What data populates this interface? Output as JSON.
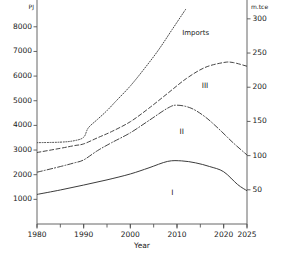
{
  "chart_data": {
    "type": "line",
    "title": "",
    "xlabel": "Year",
    "ylabel": "PJ",
    "ylabel_right": "m.tce",
    "xlim": [
      1980,
      2025
    ],
    "ylim": [
      0,
      8600
    ],
    "ylim_right": [
      0,
      310
    ],
    "grid": false,
    "legend": "none",
    "xticks": [
      1980,
      1990,
      2000,
      2010,
      2020,
      2025
    ],
    "xticklabels": [
      "1980",
      "1990",
      "2000",
      "2010",
      "2020",
      "2025"
    ],
    "yticks": [
      1000,
      2000,
      3000,
      4000,
      5000,
      6000,
      7000,
      8000
    ],
    "yticklabels": [
      "1000",
      "2000",
      "3000",
      "4000",
      "5000",
      "6000",
      "7000",
      "8000"
    ],
    "yticks_right": [
      50,
      100,
      150,
      200,
      250,
      300
    ],
    "yticklabels_right": [
      "50",
      "100",
      "150",
      "200",
      "250",
      "300"
    ],
    "annotations": [
      {
        "text": "Imports",
        "x": 2014,
        "y": 7750
      },
      {
        "text": "III",
        "x": 2016,
        "y": 5600
      },
      {
        "text": "II",
        "x": 2011,
        "y": 3750
      },
      {
        "text": "I",
        "x": 2009,
        "y": 1250
      }
    ],
    "series": [
      {
        "name": "Total demand",
        "style": "dotted",
        "x": [
          1980,
          1985,
          1988,
          1990,
          1991,
          1993,
          1995,
          1997,
          2000,
          2003,
          2006,
          2009,
          2012
        ],
        "values": [
          3300,
          3320,
          3380,
          3520,
          3900,
          4250,
          4600,
          5000,
          5600,
          6300,
          7050,
          7900,
          8750
        ]
      },
      {
        "name": "Cumulative III",
        "style": "dashed",
        "x": [
          1980,
          1985,
          1988,
          1990,
          1993,
          1996,
          2000,
          2004,
          2008,
          2012,
          2016,
          2020,
          2022,
          2025
        ],
        "values": [
          2900,
          3070,
          3180,
          3250,
          3500,
          3750,
          4150,
          4700,
          5300,
          5900,
          6350,
          6550,
          6550,
          6400
        ]
      },
      {
        "name": "Cumulative II",
        "style": "dashdot",
        "x": [
          1980,
          1985,
          1988,
          1990,
          1993,
          1996,
          2000,
          2004,
          2008,
          2010,
          2013,
          2016,
          2019,
          2022,
          2025
        ],
        "values": [
          2100,
          2330,
          2480,
          2600,
          2980,
          3300,
          3700,
          4200,
          4700,
          4820,
          4700,
          4350,
          3850,
          3300,
          2800
        ]
      },
      {
        "name": "Production I",
        "style": "solid",
        "x": [
          1980,
          1985,
          1990,
          1995,
          2000,
          2004,
          2008,
          2011,
          2014,
          2017,
          2020,
          2023,
          2025
        ],
        "values": [
          1200,
          1380,
          1580,
          1790,
          2030,
          2280,
          2540,
          2560,
          2480,
          2330,
          2120,
          1600,
          1350
        ]
      }
    ]
  }
}
